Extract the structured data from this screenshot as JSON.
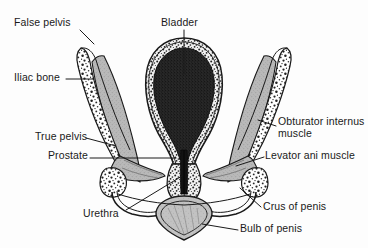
{
  "figure": {
    "width": 368,
    "height": 248,
    "background_color": "#fdfdfd",
    "line_color": "#1a1a1a",
    "bone_fill_color": "#ffffff",
    "muscle_fill_color": "#b9b9b9",
    "bladder_fill_color": "#262626",
    "label_text_color": "#1a1a1a"
  },
  "labels": {
    "false_pelvis": "False pelvis",
    "bladder": "Bladder",
    "iliac_bone": "Iliac bone",
    "obturator_internus_muscle": "Obturator internus\nmuscle",
    "true_pelvis": "True pelvis",
    "prostate": "Prostate",
    "levator_ani_muscle": "Levator ani muscle",
    "urethra": "Urethra",
    "crus_of_penis": "Crus of penis",
    "bulb_of_penis": "Bulb of penis"
  },
  "structures": [
    {
      "name": "bladder",
      "description": "large dark filled ovoid in midline upper center with thick speckled wall"
    },
    {
      "name": "iliac-bone-left",
      "description": "speckled cancellous bone wing sloping down-right from upper left"
    },
    {
      "name": "iliac-bone-right",
      "description": "speckled cancellous bone wing sloping down-left from upper right"
    },
    {
      "name": "obturator-internus-muscle-left",
      "description": "gray stippled muscle band medial to left iliac bone"
    },
    {
      "name": "obturator-internus-muscle-right",
      "description": "gray stippled muscle band medial to right iliac bone"
    },
    {
      "name": "levator-ani-muscle-left",
      "description": "gray muscle sheet sweeping medially from left pelvic wall to midline"
    },
    {
      "name": "levator-ani-muscle-right",
      "description": "gray muscle sheet sweeping medially from right pelvic wall to midline"
    },
    {
      "name": "prostate",
      "description": "midline gland below bladder surrounding the urethra"
    },
    {
      "name": "urethra",
      "description": "narrow dark midline channel descending from bladder neck through prostate"
    },
    {
      "name": "crus-of-penis-left",
      "description": "speckled oval body lateral-inferior on the left"
    },
    {
      "name": "crus-of-penis-right",
      "description": "speckled oval body lateral-inferior on the right"
    },
    {
      "name": "bulb-of-penis",
      "description": "gray shaded V-shaped midline body at the inferior margin"
    }
  ]
}
